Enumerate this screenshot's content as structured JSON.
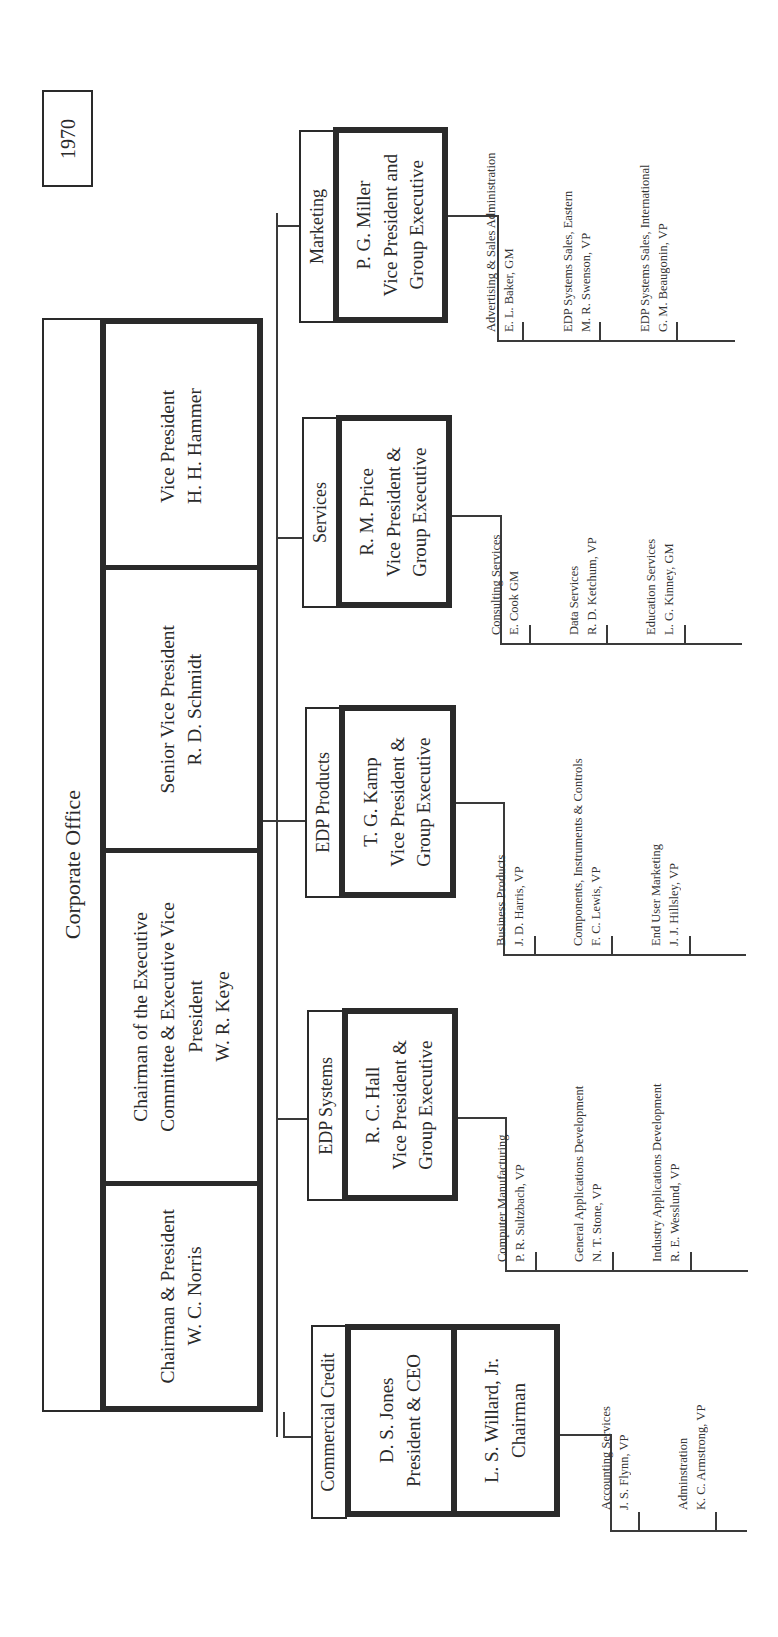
{
  "year_label": "1970",
  "corporate_office": {
    "title": "Corporate Office",
    "executives": [
      {
        "title": "Vice President",
        "name": "H. H. Hammer"
      },
      {
        "title": "Senior Vice President",
        "name": "R. D. Schmidt"
      },
      {
        "title_line1": "Chairman of the Executive",
        "title_line2": "Committee & Executive Vice",
        "title_line3": "President",
        "name": "W. R. Keye"
      },
      {
        "title": "Chairman & President",
        "name": "W. C. Norris"
      }
    ]
  },
  "groups": [
    {
      "label": "Marketing",
      "head_name": "P. G. Miller",
      "head_title_line1": "Vice President and",
      "head_title_line2": "Group Executive",
      "units": [
        {
          "unit": "Advertising & Sales Administration",
          "head": "E. L. Baker, GM"
        },
        {
          "unit": "EDP Systems Sales, Eastern",
          "head": "M. R. Swenson, VP"
        },
        {
          "unit": "EDP Systems Sales, International",
          "head": "G. M. Beaugonin, VP"
        }
      ]
    },
    {
      "label": "Services",
      "head_name": "R. M. Price",
      "head_title_line1": "Vice President &",
      "head_title_line2": "Group Executive",
      "units": [
        {
          "unit": "Consulting Services",
          "head": "E. Cook GM"
        },
        {
          "unit": "Data Services",
          "head": "R. D. Ketchum, VP"
        },
        {
          "unit": "Education Services",
          "head": "L. G. Kinney, GM"
        }
      ]
    },
    {
      "label": "EDP Products",
      "head_name": "T. G. Kamp",
      "head_title_line1": "Vice President &",
      "head_title_line2": "Group Executive",
      "units": [
        {
          "unit": "Business Products",
          "head": "J. D. Harris, VP"
        },
        {
          "unit": "Components, Instruments & Controls",
          "head": "F. C. Lewis, VP"
        },
        {
          "unit": "End User Marketing",
          "head": "J. J. Hillsley, VP"
        }
      ]
    },
    {
      "label": "EDP Systems",
      "head_name": "R. C. Hall",
      "head_title_line1": "Vice President &",
      "head_title_line2": "Group Executive",
      "units": [
        {
          "unit": "Computer Manufacturing",
          "head": "P. R. Sultzbach, VP"
        },
        {
          "unit": "General Applications Development",
          "head": "N. T. Stone, VP"
        },
        {
          "unit": "Industry Applications Development",
          "head": "R. E. Wesslund, VP"
        }
      ]
    },
    {
      "label": "Commercial Credit",
      "heads": [
        {
          "name": "D. S. Jones",
          "title": "President & CEO"
        },
        {
          "name": "L. S. Willard, Jr.",
          "title": "Chairman"
        }
      ],
      "units": [
        {
          "unit": "Accounting Services",
          "head": "J. S. Flynn, VP"
        },
        {
          "unit": "Adminstration",
          "head": "K. C. Armstrong, VP"
        }
      ]
    }
  ]
}
